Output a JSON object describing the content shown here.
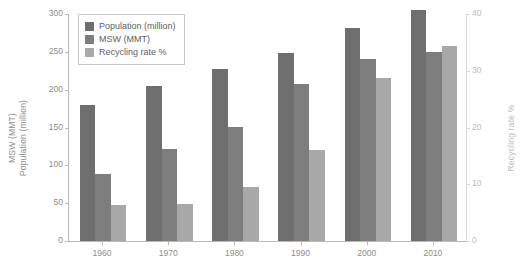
{
  "chart_data": {
    "type": "bar",
    "title": "",
    "xlabel": "",
    "ylabel": "MSW (MMT)\nPopulation (million)",
    "y2label": "Recycling rate %",
    "categories": [
      "1960",
      "1970",
      "1980",
      "1990",
      "2000",
      "2010"
    ],
    "series": [
      {
        "name": "Population (million)",
        "axis": "left",
        "color": "#6e6e6e",
        "values": [
          180,
          205,
          227,
          249,
          281,
          305
        ]
      },
      {
        "name": "MSW (MMT)",
        "axis": "left",
        "color": "#7d7d7d",
        "values": [
          88,
          121,
          151,
          208,
          241,
          250
        ]
      },
      {
        "name": "Recycling rate %",
        "axis": "right",
        "color": "#a8a8a8",
        "values": [
          6.4,
          6.6,
          9.6,
          16.0,
          28.8,
          34.4
        ]
      }
    ],
    "ylim": [
      0,
      300
    ],
    "yticks": [
      "0",
      "50",
      "100",
      "150",
      "200",
      "250",
      "300"
    ],
    "y2lim": [
      0,
      40
    ],
    "y2ticks": [
      "0",
      "10",
      "20",
      "30",
      "40"
    ],
    "grid": false,
    "legend_position": "top-left",
    "legend_entries": [
      "Population (million)",
      "MSW (MMT)",
      "Recycling rate %"
    ]
  },
  "axis_label_left_line1": "MSW (MMT)",
  "axis_label_left_line2": "Population (million)"
}
